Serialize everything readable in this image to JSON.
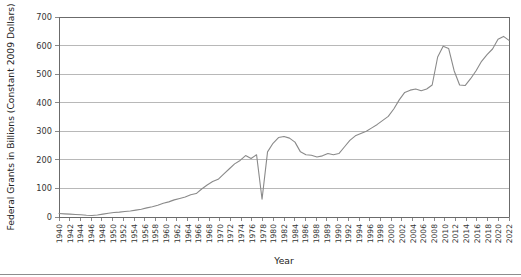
{
  "chart_data": {
    "type": "line",
    "title": "",
    "xlabel": "Year",
    "ylabel": "Federal Grants in Billions (Constant 2009 Dollars)",
    "ylim": [
      0,
      700
    ],
    "yticks": [
      0,
      100,
      200,
      300,
      400,
      500,
      600,
      700
    ],
    "grid": true,
    "legend": false,
    "legend_position": "none",
    "xtick_labels": [
      "1940",
      "1942",
      "1944",
      "1946",
      "1948",
      "1950",
      "1952",
      "1954",
      "1956",
      "1958",
      "1960",
      "1962",
      "1964",
      "1966",
      "1968",
      "1970",
      "1972",
      "1974",
      "1976",
      "1978",
      "1980",
      "1982",
      "1984",
      "1986",
      "1988",
      "1989",
      "1990",
      "1992",
      "1994",
      "1996",
      "1998",
      "2000",
      "2002",
      "2004",
      "2006",
      "2008",
      "2010",
      "2012",
      "2014",
      "2016",
      "2018",
      "2020",
      "2022"
    ],
    "x": [
      1940,
      1941,
      1942,
      1943,
      1944,
      1945,
      1946,
      1947,
      1948,
      1949,
      1950,
      1951,
      1952,
      1953,
      1954,
      1955,
      1956,
      1957,
      1958,
      1959,
      1960,
      1961,
      1962,
      1963,
      1964,
      1965,
      1966,
      1967,
      1968,
      1969,
      1970,
      1971,
      1972,
      1973,
      1974,
      1975,
      1976,
      1977,
      1978,
      1979,
      1980,
      1981,
      1982,
      1983,
      1984,
      1985,
      1986,
      1987,
      1988,
      1989,
      1990,
      1991,
      1992,
      1993,
      1994,
      1995,
      1996,
      1997,
      1998,
      1999,
      2000,
      2001,
      2002,
      2003,
      2004,
      2005,
      2006,
      2007,
      2008,
      2009,
      2010,
      2011,
      2012,
      2013,
      2014,
      2015,
      2016,
      2017,
      2018,
      2019,
      2020,
      2021,
      2022
    ],
    "values": [
      12,
      11,
      10,
      9,
      8,
      6,
      5,
      7,
      10,
      13,
      16,
      17,
      19,
      21,
      24,
      27,
      32,
      36,
      41,
      48,
      53,
      60,
      65,
      70,
      78,
      82,
      98,
      112,
      124,
      132,
      150,
      168,
      186,
      198,
      215,
      205,
      218,
      62,
      228,
      258,
      278,
      282,
      276,
      262,
      228,
      218,
      216,
      210,
      214,
      222,
      218,
      222,
      245,
      268,
      284,
      292,
      300,
      312,
      324,
      338,
      352,
      378,
      410,
      436,
      444,
      448,
      442,
      448,
      462,
      560,
      598,
      590,
      512,
      462,
      460,
      484,
      512,
      545,
      568,
      588,
      622,
      632,
      618
    ],
    "line_color": "#8a8a8a",
    "grid_color": "#9a9a9a",
    "axis_color": "#6b6b6b",
    "background_color": "#ffffff",
    "annotations": []
  }
}
